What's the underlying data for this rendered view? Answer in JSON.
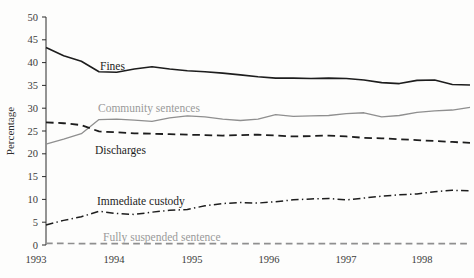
{
  "chart_data": {
    "type": "line",
    "title": "",
    "subtitle": "",
    "xlabel": "",
    "ylabel": "Percentage",
    "ylim": [
      0,
      50
    ],
    "ytick_step": 5,
    "yticks": [
      0,
      5,
      10,
      15,
      20,
      25,
      30,
      35,
      40,
      45,
      50
    ],
    "ytick_labels": [
      "0",
      "5",
      "10",
      "15",
      "20",
      "25",
      "30",
      "35",
      "40",
      "45",
      "50"
    ],
    "xtick_labels": [
      "1993",
      "1994",
      "1995",
      "1996",
      "1997",
      "1998"
    ],
    "xlim": [
      1993.0,
      1999.0
    ],
    "x_unit": "quarter",
    "grid": false,
    "legend_position": "inline-annotations",
    "x": [
      1993.0,
      1993.25,
      1993.5,
      1993.75,
      1994.0,
      1994.25,
      1994.5,
      1994.75,
      1995.0,
      1995.25,
      1995.5,
      1995.75,
      1996.0,
      1996.25,
      1996.5,
      1996.75,
      1997.0,
      1997.25,
      1997.5,
      1997.75,
      1998.0,
      1998.25,
      1998.5,
      1998.75,
      1999.0
    ],
    "series": [
      {
        "name": "Fines",
        "label": "Fines",
        "color": "#1d1d1d",
        "style": "solid",
        "width": 1.6,
        "label_tone": "dark",
        "label_x": 100,
        "label_y": 70,
        "values": [
          43.3,
          41.5,
          40.3,
          38.0,
          37.9,
          38.6,
          39.1,
          38.6,
          38.2,
          38.0,
          37.7,
          37.3,
          36.9,
          36.6,
          36.6,
          36.5,
          36.6,
          36.5,
          36.2,
          35.6,
          35.4,
          36.1,
          36.2,
          35.2,
          35.1
        ]
      },
      {
        "name": "Community sentences",
        "label": "Community sentences",
        "color": "#8f8f8f",
        "style": "solid",
        "width": 1.3,
        "label_tone": "light",
        "label_x": 98,
        "label_y": 112,
        "values": [
          22.1,
          23.2,
          24.4,
          27.5,
          27.6,
          27.4,
          27.1,
          27.9,
          28.3,
          28.1,
          27.6,
          27.3,
          27.6,
          28.6,
          28.2,
          28.3,
          28.4,
          28.8,
          29.0,
          28.1,
          28.4,
          29.1,
          29.4,
          29.6,
          30.2
        ]
      },
      {
        "name": "Discharges",
        "label": "Discharges",
        "color": "#1d1d1d",
        "style": "dashed",
        "width": 1.8,
        "label_tone": "dark",
        "label_x": 95,
        "label_y": 154,
        "values": [
          26.9,
          26.7,
          26.3,
          24.9,
          24.7,
          24.5,
          24.4,
          24.3,
          24.2,
          24.1,
          24.0,
          24.1,
          24.2,
          24.0,
          23.8,
          23.9,
          24.0,
          23.8,
          23.5,
          23.4,
          23.2,
          23.0,
          22.8,
          22.6,
          22.4
        ]
      },
      {
        "name": "Immediate custody",
        "label": "Immediate custody",
        "color": "#1d1d1d",
        "style": "dashdot",
        "width": 1.5,
        "label_tone": "dark",
        "label_x": 97,
        "label_y": 205,
        "values": [
          4.4,
          5.4,
          6.2,
          7.4,
          6.9,
          6.7,
          7.2,
          7.6,
          7.8,
          8.6,
          9.1,
          9.3,
          9.2,
          9.5,
          9.9,
          10.1,
          10.2,
          9.9,
          10.3,
          10.7,
          11.0,
          11.2,
          11.7,
          12.0,
          11.9
        ]
      },
      {
        "name": "Fully suspended sentence",
        "label": "Fully suspended sentence",
        "color": "#8f8f8f",
        "style": "dashed",
        "width": 1.6,
        "label_tone": "light",
        "label_x": 103,
        "label_y": 241,
        "values": [
          0.35,
          0.35,
          0.3,
          0.3,
          0.3,
          0.3,
          0.3,
          0.3,
          0.3,
          0.3,
          0.3,
          0.3,
          0.3,
          0.3,
          0.3,
          0.3,
          0.3,
          0.3,
          0.3,
          0.3,
          0.3,
          0.3,
          0.3,
          0.3,
          0.3
        ]
      }
    ]
  },
  "plot_geometry": {
    "left": 46,
    "right": 470,
    "top": 17,
    "bottom": 245,
    "year_tick_pixels": [
      36,
      114,
      192,
      269,
      346,
      422
    ]
  }
}
